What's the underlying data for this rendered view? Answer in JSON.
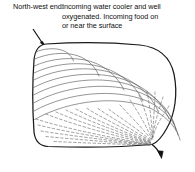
{
  "caption": {
    "label": "North-west end:",
    "lines": [
      "Incoming water cooler and well",
      "oxygenated. Incoming food on",
      "or near the surface"
    ]
  },
  "figure": {
    "outline_name": "lake-outline",
    "inflow_arrow_name": "inflow-arrow",
    "outflow_arrow_name": "outflow-arrow",
    "surface_flow_name": "surface-flow-arcs",
    "deep_flow_name": "converging-streamlines",
    "colors": {
      "outline": "#1a1a1a",
      "flow_line": "#555555",
      "dashed_line": "#666666",
      "arrow": "#111111",
      "background": "#ffffff",
      "text": "#111111"
    },
    "geometry": {
      "outline_bounds": {
        "x": 33,
        "y": 43,
        "width": 142,
        "height": 105
      },
      "inflow_point": {
        "x": 46,
        "y": 48
      },
      "outflow_point": {
        "x": 160,
        "y": 150
      },
      "convergence_point": {
        "x": 152,
        "y": 144
      },
      "surface_arc_count": 10,
      "streamline_count": 19
    }
  }
}
